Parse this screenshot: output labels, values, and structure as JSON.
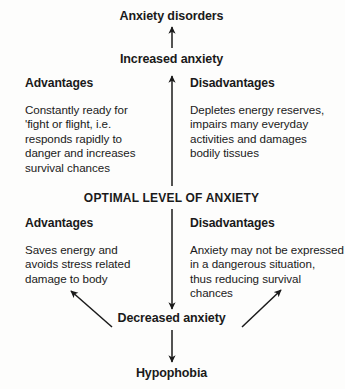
{
  "diagram": {
    "title_top": "Anxiety disorders",
    "node_increased": "Increased anxiety",
    "node_optimal": "OPTIMAL LEVEL OF ANXIETY",
    "node_decreased": "Decreased anxiety",
    "node_bottom": "Hypophobia",
    "upper": {
      "advantages_heading": "Advantages",
      "advantages_text": "Constantly ready for\n'fight or flight, i.e.\nresponds rapidly to\ndanger and increases\nsurvival chances",
      "disadvantages_heading": "Disadvantages",
      "disadvantages_text": "Depletes energy reserves,\nimpairs many everyday\nactivities and damages\nbodily tissues"
    },
    "lower": {
      "advantages_heading": "Advantages",
      "advantages_text": "Saves energy and\navoids stress related\ndamage to body",
      "disadvantages_heading": "Disadvantages",
      "disadvantages_text": "Anxiety may not be expressed\nin a dangerous situation,\nthus reducing survival chances"
    },
    "colors": {
      "ink": "#1a1a1a",
      "background": "#fdfdfc"
    },
    "arrows": [
      {
        "name": "increased-to-disorders",
        "direction": "up"
      },
      {
        "name": "optimal-to-increased",
        "direction": "up"
      },
      {
        "name": "optimal-to-decreased",
        "direction": "down"
      },
      {
        "name": "decreased-to-hypophobia",
        "direction": "down"
      },
      {
        "name": "decreased-to-advantages",
        "direction": "up-left"
      },
      {
        "name": "decreased-to-disadvantages",
        "direction": "up-right"
      }
    ]
  }
}
